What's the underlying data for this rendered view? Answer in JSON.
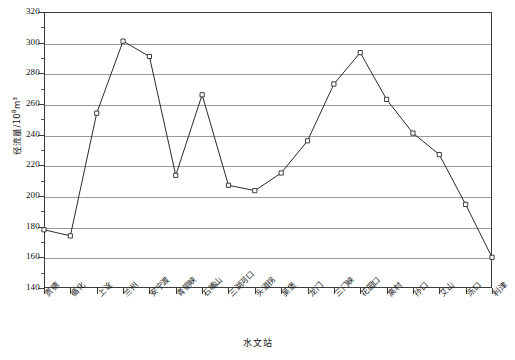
{
  "chart_data": {
    "type": "line",
    "title": "",
    "xlabel": "水文站",
    "ylabel": "径流量/10⁸m³",
    "ylabel_base": "径流量/10",
    "ylabel_exp": "8",
    "ylabel_unit": "m³",
    "ylim": [
      140,
      320
    ],
    "ytick_step": 20,
    "yticks": [
      140,
      160,
      180,
      200,
      220,
      240,
      260,
      280,
      300,
      320
    ],
    "grid": true,
    "legend": "none",
    "marker": "open-square",
    "line_color": "#2b2b2b",
    "grid_color": "#9a9a9a",
    "axis_color": "#3b3b3b",
    "categories": [
      "贵德",
      "循化",
      "上诠",
      "兰州",
      "安宁渡",
      "青铜峡",
      "石嘴山",
      "三湖河口",
      "头道拐",
      "吴堡",
      "龙门",
      "三门峡",
      "花园口",
      "高村",
      "孙口",
      "艾山",
      "泺口",
      "利津"
    ],
    "values": [
      178,
      174,
      254,
      301,
      291,
      213.5,
      266,
      207,
      203.5,
      215,
      236,
      273,
      293.5,
      263,
      241,
      227,
      194.5,
      160
    ],
    "points": [
      {
        "station": "贵德",
        "value": 178
      },
      {
        "station": "循化",
        "value": 174
      },
      {
        "station": "上诠",
        "value": 254
      },
      {
        "station": "兰州",
        "value": 301
      },
      {
        "station": "安宁渡",
        "value": 291
      },
      {
        "station": "青铜峡",
        "value": 213.5
      },
      {
        "station": "石嘴山",
        "value": 266
      },
      {
        "station": "三湖河口",
        "value": 207
      },
      {
        "station": "头道拐",
        "value": 203.5
      },
      {
        "station": "吴堡",
        "value": 215
      },
      {
        "station": "龙门",
        "value": 236
      },
      {
        "station": "三门峡",
        "value": 273
      },
      {
        "station": "花园口",
        "value": 293.5
      },
      {
        "station": "高村",
        "value": 263
      },
      {
        "station": "孙口",
        "value": 241
      },
      {
        "station": "艾山",
        "value": 227
      },
      {
        "station": "泺口",
        "value": 194.5
      },
      {
        "station": "利津",
        "value": 160
      }
    ]
  }
}
